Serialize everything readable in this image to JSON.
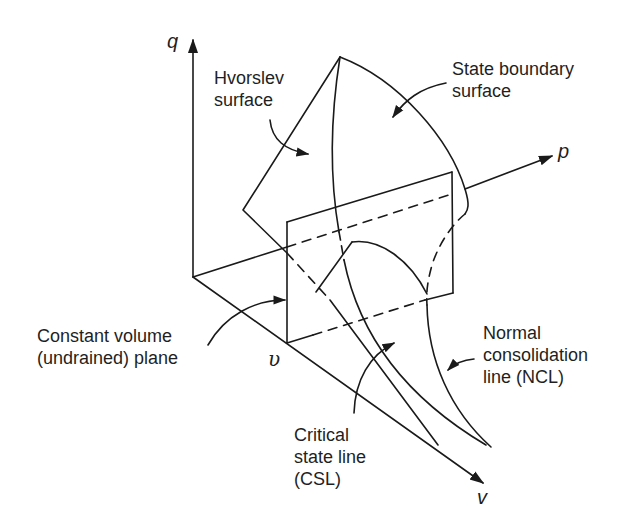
{
  "figure": {
    "type": "3D state boundary diagram (q-p-v space)",
    "axes": {
      "q": "q",
      "p": "p",
      "v": "v",
      "v_plane": "υ"
    },
    "labels": {
      "hvorslev": [
        "Hvorslev",
        "surface"
      ],
      "state_boundary": [
        "State boundary",
        "surface"
      ],
      "constant_volume": [
        "Constant volume",
        "(undrained) plane"
      ],
      "ncl": [
        "Normal",
        "consolidation",
        "line (NCL)"
      ],
      "csl": [
        "Critical",
        "state line",
        "(CSL)"
      ]
    },
    "colors": {
      "line": "#1a1a1a",
      "background": "#ffffff"
    }
  }
}
